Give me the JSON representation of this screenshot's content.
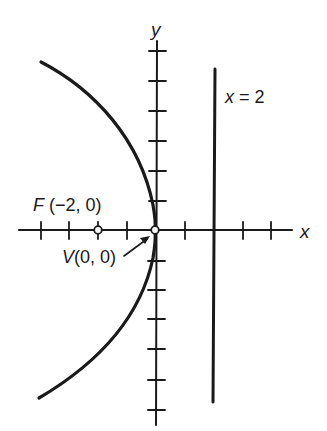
{
  "figure": {
    "type": "parabola-diagram",
    "equation_implied": "y^2 = -8x",
    "axes": {
      "x_label": "x",
      "y_label": "y",
      "x_ticks": [
        -5,
        -4,
        -3,
        -2,
        -1,
        1,
        2,
        3,
        4
      ],
      "y_ticks": [
        -6,
        -5,
        -4,
        -3,
        -2,
        -1,
        1,
        2,
        3,
        4,
        5,
        6
      ],
      "tick_spacing_px": 29
    },
    "directrix": {
      "label_var": "x",
      "label_eq": " = 2",
      "x": 2
    },
    "focus": {
      "label_letter": "F",
      "label_coords": "(−2, 0)",
      "x": -2,
      "y": 0
    },
    "vertex": {
      "label_letter": "V",
      "label_coords": "(0, 0)",
      "x": 0,
      "y": 0
    },
    "colors": {
      "ink": "#1a1a1a",
      "background": "#ffffff"
    }
  }
}
